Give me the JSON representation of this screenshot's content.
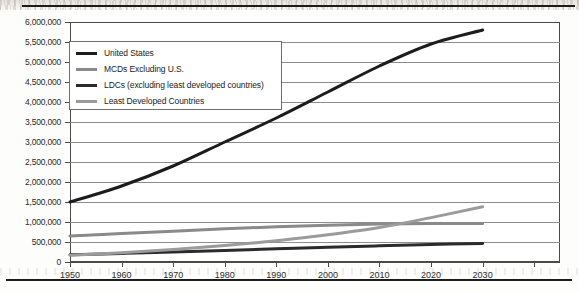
{
  "page": {
    "background_color": "#fdfdfc",
    "rule_color": "#1b1b1b"
  },
  "chart_data": {
    "type": "line",
    "title": "",
    "subtitle": "",
    "xlabel": "",
    "ylabel": "",
    "x": [
      1950,
      1960,
      1970,
      1980,
      1990,
      2000,
      2010,
      2020,
      2030
    ],
    "categories": [
      "1950",
      "1960",
      "1970",
      "1980",
      "1990",
      "2000",
      "2010",
      "2020",
      "2030"
    ],
    "xlim": [
      1950,
      2045
    ],
    "ylim": [
      0,
      6000000
    ],
    "ytick_values": [
      0,
      500000,
      1000000,
      1500000,
      2000000,
      2500000,
      3000000,
      3500000,
      4000000,
      4500000,
      5000000,
      5500000,
      6000000
    ],
    "ytick_labels": [
      "0",
      "500,000",
      "1,000,000",
      "1,500,000",
      "2,000,000",
      "2,500,000",
      "3,000,000",
      "3,500,000",
      "4,000,000",
      "4,500,000",
      "5,000,000",
      "5,500,000",
      "6,000,000"
    ],
    "xtick_labels": [
      "1950",
      "1960",
      "1970",
      "1980",
      "1990",
      "2000",
      "2010",
      "2020",
      "2030"
    ],
    "grid": "horizontal",
    "grid_color": "#8d8d8d",
    "axis_color": "#4a4a4a",
    "legend_position": "top-left",
    "series": [
      {
        "name": "United States",
        "color": "#1c1c1c",
        "width": 3.0,
        "values": [
          1500000,
          1900000,
          2400000,
          3000000,
          3600000,
          4250000,
          4900000,
          5450000,
          5800000
        ]
      },
      {
        "name": "MCDs Excluding U.S.",
        "color": "#8a8a8a",
        "width": 3.0,
        "values": [
          650000,
          710000,
          770000,
          830000,
          880000,
          920000,
          950000,
          960000,
          960000
        ]
      },
      {
        "name": "LDCs (excluding least developed countries)",
        "color": "#2b2b2b",
        "width": 3.0,
        "values": [
          180000,
          215000,
          250000,
          290000,
          330000,
          370000,
          405000,
          440000,
          465000
        ]
      },
      {
        "name": "Least Developed Countries",
        "color": "#9b9b9b",
        "width": 3.0,
        "values": [
          170000,
          230000,
          310000,
          410000,
          530000,
          680000,
          860000,
          1110000,
          1380000
        ]
      }
    ]
  },
  "legend": {
    "items": [
      {
        "label": "United States",
        "color": "#1c1c1c"
      },
      {
        "label": "MCDs Excluding U.S.",
        "color": "#8a8a8a"
      },
      {
        "label": "LDCs (excluding least developed countries)",
        "color": "#2b2b2b"
      },
      {
        "label": "Least Developed Countries",
        "color": "#9b9b9b"
      }
    ]
  }
}
